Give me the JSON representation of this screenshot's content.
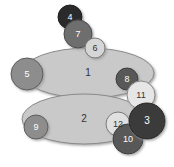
{
  "figure": {
    "type": "node-overlap-diagram",
    "width": 174,
    "height": 167,
    "background": "#ffffff"
  },
  "palette": {
    "ellipse_fill": "#c9c9c9",
    "ellipse_stroke": "#8a8a8a",
    "shadow": "#b0b0b0",
    "very_dark": "#2b2b2b",
    "dark": "#3a3a3a",
    "mid_dark": "#585858",
    "mid": "#6e6e6e",
    "mid_light": "#8d8d8d",
    "light": "#d6d6d6",
    "very_light": "#e6e6e6",
    "label_light": "#ffffff",
    "label_dark": "#333333"
  },
  "ellipses": [
    {
      "id": "ellipse-1",
      "label": "1",
      "cx": 88,
      "cy": 73,
      "rx": 66,
      "ry": 25,
      "fill": "#c9c9c9",
      "stroke": "#8a8a8a",
      "label_color": "#333333",
      "label_size": 10
    },
    {
      "id": "ellipse-2",
      "label": "2",
      "cx": 84,
      "cy": 119,
      "rx": 62,
      "ry": 25,
      "fill": "#c9c9c9",
      "stroke": "#8a8a8a",
      "label_color": "#333333",
      "label_size": 10
    }
  ],
  "circles": [
    {
      "id": "circle-4",
      "label": "4",
      "cx": 70,
      "cy": 17,
      "r": 12,
      "fill": "#2b2b2b",
      "stroke": "#1a1a1a",
      "label_color": "#ffffff",
      "label_size": 9
    },
    {
      "id": "circle-7",
      "label": "7",
      "cx": 78,
      "cy": 34,
      "r": 14,
      "fill": "#6e6e6e",
      "stroke": "#4a4a4a",
      "label_color": "#ffffff",
      "label_size": 9
    },
    {
      "id": "circle-6",
      "label": "6",
      "cx": 95,
      "cy": 48,
      "r": 10,
      "fill": "#d6d6d6",
      "stroke": "#7a7a7a",
      "label_color": "#333333",
      "label_size": 9
    },
    {
      "id": "circle-5",
      "label": "5",
      "cx": 27,
      "cy": 74,
      "r": 16,
      "fill": "#8d8d8d",
      "stroke": "#5c5c5c",
      "label_color": "#ffffff",
      "label_size": 9
    },
    {
      "id": "circle-8",
      "label": "8",
      "cx": 127,
      "cy": 79,
      "r": 11,
      "fill": "#585858",
      "stroke": "#3c3c3c",
      "label_color": "#ffffff",
      "label_size": 9
    },
    {
      "id": "circle-11",
      "label": "11",
      "cx": 141,
      "cy": 95,
      "r": 14,
      "fill": "#e6e6e6",
      "stroke": "#8a8a8a",
      "label_color": "#333333",
      "label_size": 9
    },
    {
      "id": "circle-3",
      "label": "3",
      "cx": 147,
      "cy": 121,
      "r": 18,
      "fill": "#3a3a3a",
      "stroke": "#222222",
      "label_color": "#ffffff",
      "label_size": 10
    },
    {
      "id": "circle-12",
      "label": "12",
      "cx": 118,
      "cy": 124,
      "r": 12,
      "fill": "#e0e0e0",
      "stroke": "#7a7a7a",
      "label_color": "#333333",
      "label_size": 9
    },
    {
      "id": "circle-10",
      "label": "10",
      "cx": 128,
      "cy": 139,
      "r": 15,
      "fill": "#585858",
      "stroke": "#3c3c3c",
      "label_color": "#ffffff",
      "label_size": 9
    },
    {
      "id": "circle-9",
      "label": "9",
      "cx": 36,
      "cy": 127,
      "r": 12,
      "fill": "#8d8d8d",
      "stroke": "#5c5c5c",
      "label_color": "#ffffff",
      "label_size": 9
    }
  ],
  "draw_order": [
    "ellipse-1",
    "ellipse-2",
    "circle-5",
    "circle-9",
    "circle-4",
    "circle-7",
    "circle-6",
    "circle-8",
    "circle-11",
    "circle-12",
    "circle-10",
    "circle-3"
  ]
}
